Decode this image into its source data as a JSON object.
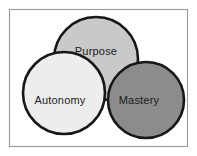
{
  "diagram": {
    "background_color": "#ffffff",
    "frame": {
      "name": "diagram-frame",
      "x": 9.5,
      "y": 9.5,
      "width": 178,
      "height": 137,
      "stroke_color": "#9a9a9a",
      "fill_color": "#ffffff"
    },
    "outline_color": "#171717",
    "label_color": "#1c1c1c",
    "circles": [
      {
        "id": "purpose",
        "label": "Purpose",
        "cx": 96,
        "cy": 59,
        "r": 42,
        "fill": "#c9c9c9",
        "label_x": 96,
        "label_y": 52,
        "z": 1
      },
      {
        "id": "mastery",
        "label": "Mastery",
        "cx": 146,
        "cy": 100,
        "r": 38,
        "fill": "#8c8c8c",
        "label_x": 139,
        "label_y": 101,
        "z": 2
      },
      {
        "id": "autonomy",
        "label": "Autonomy",
        "cx": 64,
        "cy": 93,
        "r": 41,
        "fill": "#ededed",
        "label_x": 60,
        "label_y": 101,
        "z": 3
      }
    ]
  }
}
